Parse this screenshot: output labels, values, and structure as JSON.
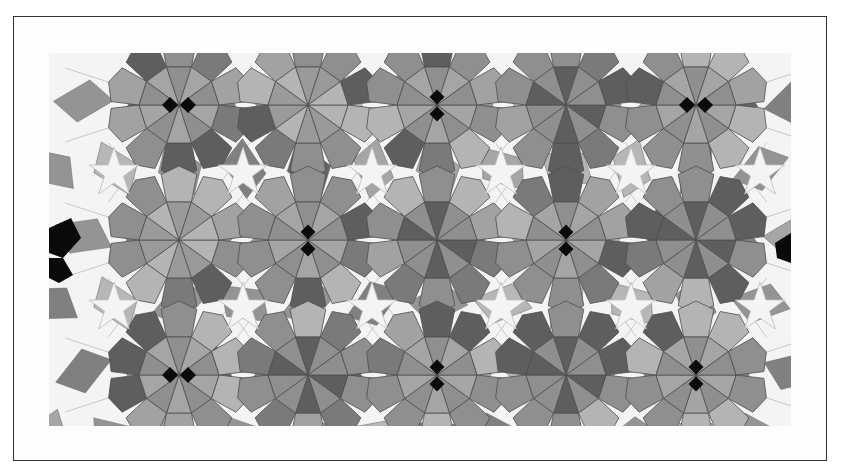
{
  "figure": {
    "colors": {
      "background": "#ffffff",
      "frame_border": "#333333",
      "ground": "#f4f4f4",
      "grid_line": "#bdbdbd",
      "tile_light": "#b4b4b4",
      "tile_mid": "#8f8f8f",
      "tile_dark": "#5e5e5e",
      "tile_black": "#0a0a0a"
    },
    "rosettes": [
      {
        "cx": 130,
        "cy": 52,
        "style": "pair-h"
      },
      {
        "cx": 259,
        "cy": 52,
        "style": "light"
      },
      {
        "cx": 388,
        "cy": 52,
        "style": "pair-v"
      },
      {
        "cx": 517,
        "cy": 52,
        "style": "dark"
      },
      {
        "cx": 647,
        "cy": 52,
        "style": "pair-h"
      },
      {
        "cx": 130,
        "cy": 187,
        "style": "light"
      },
      {
        "cx": 259,
        "cy": 187,
        "style": "pair-v"
      },
      {
        "cx": 388,
        "cy": 187,
        "style": "dark"
      },
      {
        "cx": 517,
        "cy": 187,
        "style": "pair-v"
      },
      {
        "cx": 647,
        "cy": 187,
        "style": "dark"
      },
      {
        "cx": 130,
        "cy": 322,
        "style": "pair-h"
      },
      {
        "cx": 259,
        "cy": 322,
        "style": "dark"
      },
      {
        "cx": 388,
        "cy": 322,
        "style": "pair-v"
      },
      {
        "cx": 517,
        "cy": 322,
        "style": "dark"
      },
      {
        "cx": 647,
        "cy": 322,
        "style": "pair-v"
      }
    ]
  }
}
